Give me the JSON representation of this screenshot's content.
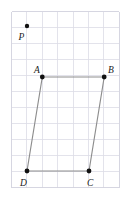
{
  "figure": {
    "background_color": "#ffffff",
    "grid": {
      "line_color": "#dcdce6",
      "border_color": "#d2d2de",
      "x_start": 11.5,
      "y_start": 11.5,
      "cell_width": 15.4,
      "cell_height": 16.0,
      "columns": 7,
      "rows": 11
    },
    "edge_color": "#8d8d8d",
    "dot_color": "#111111",
    "labels": {
      "p": "P",
      "a": "A",
      "b": "B",
      "c": "C",
      "d": "D"
    },
    "points": {
      "p": {
        "name": "P",
        "x": 27.0,
        "y": 26.0,
        "label_x": 18.5,
        "label_y": 39.5,
        "r": 2.2
      },
      "a": {
        "name": "A",
        "x": 42.3,
        "y": 77.0,
        "label_x": 34.0,
        "label_y": 73.0,
        "r": 2.4
      },
      "b": {
        "name": "B",
        "x": 104.2,
        "y": 77.0,
        "label_x": 108.0,
        "label_y": 73.0,
        "r": 2.4
      },
      "c": {
        "name": "C",
        "x": 89.0,
        "y": 171.0,
        "label_x": 87.0,
        "label_y": 186.0,
        "r": 2.4
      },
      "d": {
        "name": "D",
        "x": 27.0,
        "y": 171.0,
        "label_x": 20.0,
        "label_y": 186.0,
        "r": 2.4
      }
    },
    "edges": [
      {
        "name": "edge-ab",
        "from": "A",
        "to": "B",
        "x1": 42.3,
        "y1": 77.0,
        "x2": 104.2,
        "y2": 77.0
      },
      {
        "name": "edge-bc",
        "from": "B",
        "to": "C",
        "x1": 104.2,
        "y1": 77.0,
        "x2": 89.0,
        "y2": 171.0
      },
      {
        "name": "edge-cd",
        "from": "C",
        "to": "D",
        "x1": 89.0,
        "y1": 171.0,
        "x2": 27.0,
        "y2": 171.0
      },
      {
        "name": "edge-da",
        "from": "D",
        "to": "A",
        "x1": 27.0,
        "y1": 171.0,
        "x2": 42.3,
        "y2": 77.0
      }
    ]
  }
}
